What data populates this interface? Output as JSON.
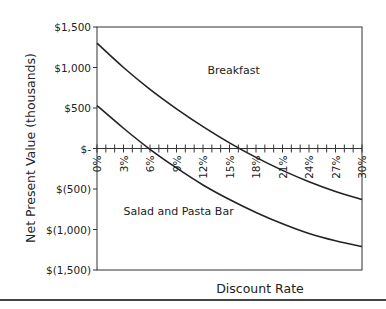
{
  "chart_data": {
    "type": "line",
    "title": "",
    "xlabel": "Discount Rate",
    "ylabel": "Net Present Value (thousands)",
    "x": [
      "0%",
      "3%",
      "6%",
      "9%",
      "12%",
      "15%",
      "18%",
      "21%",
      "24%",
      "27%",
      "30%"
    ],
    "x_values": [
      0,
      3,
      6,
      9,
      12,
      15,
      18,
      21,
      24,
      27,
      30
    ],
    "ylim": [
      -1500,
      1500
    ],
    "xlim": [
      0,
      30
    ],
    "y_ticks": [
      1500,
      1000,
      500,
      0,
      -500,
      -1000,
      -1500
    ],
    "y_tick_labels": [
      "$1,500",
      "$1,000",
      "$500",
      "$-",
      "$(500)",
      "$(1,000)",
      "$(1,500)"
    ],
    "grid": false,
    "legend": "inline labels",
    "series": [
      {
        "name": "Breakfast",
        "values": [
          1300,
          1000,
          730,
          490,
          270,
          70,
          -110,
          -270,
          -410,
          -530,
          -630
        ]
      },
      {
        "name": "Salad and Pasta Bar",
        "values": [
          530,
          250,
          -10,
          -240,
          -450,
          -630,
          -790,
          -930,
          -1050,
          -1140,
          -1210
        ]
      }
    ],
    "annotations": [
      {
        "text": "Breakfast",
        "x_pct": 12.5,
        "y": 920
      },
      {
        "text": "Salad and Pasta Bar",
        "x_pct": 3,
        "y": -820
      }
    ]
  }
}
